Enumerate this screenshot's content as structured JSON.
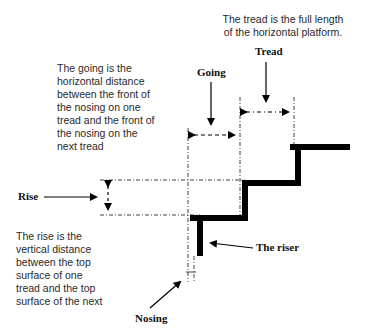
{
  "diagram": {
    "tread_note": [
      "The tread is the full length",
      "of the horizontal platform."
    ],
    "going_note": [
      "The going is the",
      "horizontal distance",
      "between the front of",
      "the nosing on one",
      "tread and the front of",
      "the nosing on the",
      "next tread"
    ],
    "rise_note": [
      "The rise is the",
      "vertical distance",
      "between the top",
      "surface of one",
      "tread and the top",
      "surface of the next"
    ],
    "labels": {
      "tread": "Tread",
      "going": "Going",
      "rise": "Rise",
      "riser": "The riser",
      "nosing": "Nosing"
    },
    "colors": {
      "stair": "#000000",
      "text": "#2a2a2a",
      "guides": "#333333"
    }
  }
}
